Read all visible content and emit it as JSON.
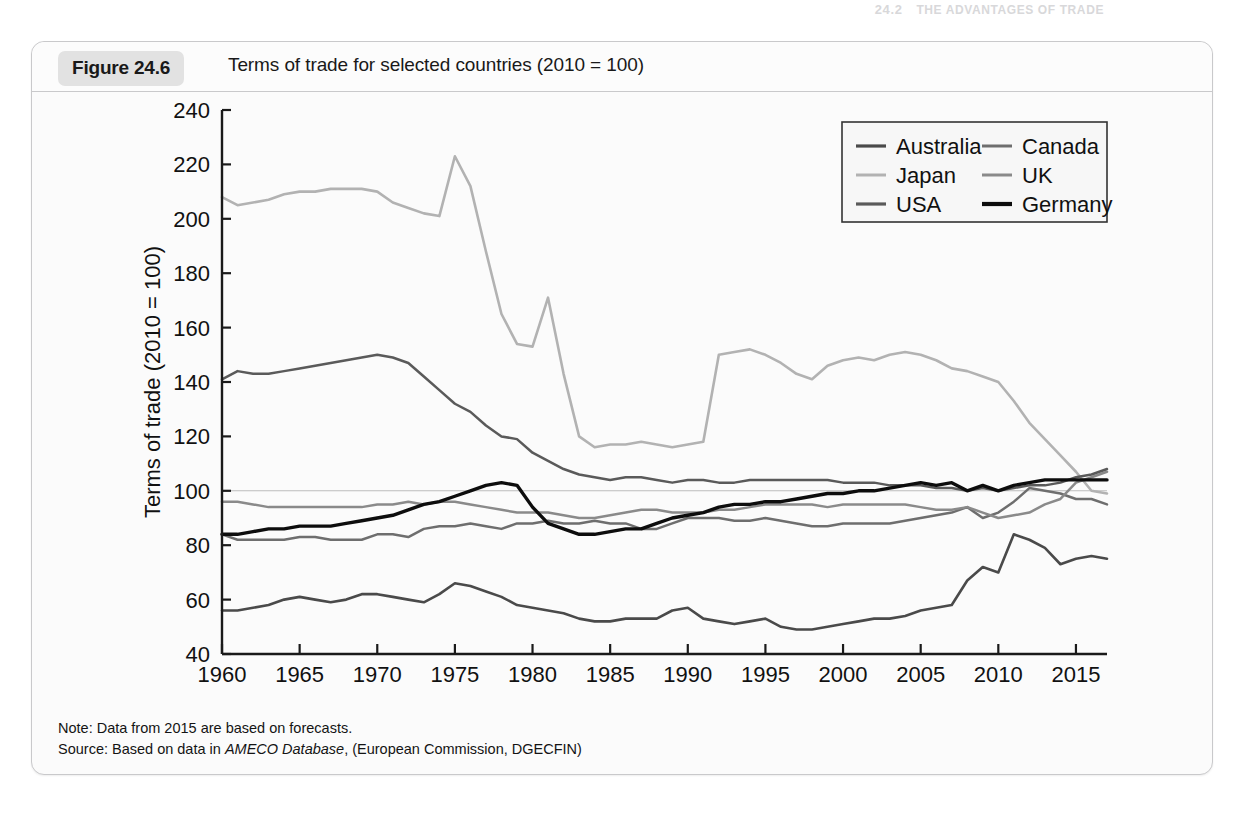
{
  "page_header": {
    "chapter_number": "24.2",
    "running_head": "THE ADVANTAGES OF TRADE"
  },
  "figure": {
    "number_label": "Figure 24.6",
    "title": "Terms of trade for selected countries (2010 = 100)",
    "note": "Note: Data from 2015 are based on forecasts.",
    "source_prefix": "Source: Based on data in ",
    "source_italic": "AMECO Database",
    "source_suffix": ", (European Commission, DGECFIN)"
  },
  "colors": {
    "australia": "#4a4a4a",
    "canada": "#6e6e6e",
    "japan": "#b2b2b2",
    "uk": "#8a8a8a",
    "usa": "#5a5a5a",
    "germany": "#0d0d0d",
    "axis": "#1a1a1a",
    "reference_line": "#bdbdbd",
    "card_bg": "#fbfbfb",
    "card_border": "#c9c9cb",
    "badge_bg": "#e2e2e2"
  },
  "chart_data": {
    "type": "line",
    "title": "Terms of trade for selected countries (2010 = 100)",
    "xlabel": "",
    "ylabel": "Terms of trade (2010 = 100)",
    "xlim": [
      1960,
      2017
    ],
    "ylim": [
      40,
      240
    ],
    "ytick_step": 20,
    "yticks": [
      40,
      60,
      80,
      100,
      120,
      140,
      160,
      180,
      200,
      220,
      240
    ],
    "xticks": [
      1960,
      1965,
      1970,
      1975,
      1980,
      1985,
      1990,
      1995,
      2000,
      2005,
      2010,
      2015
    ],
    "grid": false,
    "reference_line_y": 100,
    "legend_position": "top-right",
    "legend_columns": 2,
    "x": [
      1960,
      1961,
      1962,
      1963,
      1964,
      1965,
      1966,
      1967,
      1968,
      1969,
      1970,
      1971,
      1972,
      1973,
      1974,
      1975,
      1976,
      1977,
      1978,
      1979,
      1980,
      1981,
      1982,
      1983,
      1984,
      1985,
      1986,
      1987,
      1988,
      1989,
      1990,
      1991,
      1992,
      1993,
      1994,
      1995,
      1996,
      1997,
      1998,
      1999,
      2000,
      2001,
      2002,
      2003,
      2004,
      2005,
      2006,
      2007,
      2008,
      2009,
      2010,
      2011,
      2012,
      2013,
      2014,
      2015,
      2016,
      2017
    ],
    "series": [
      {
        "name": "Japan",
        "color": "#b2b2b2",
        "width": 2.6,
        "values": [
          208,
          205,
          206,
          207,
          209,
          210,
          210,
          211,
          211,
          211,
          210,
          206,
          204,
          202,
          201,
          223,
          212,
          188,
          165,
          154,
          153,
          171,
          143,
          120,
          116,
          117,
          117,
          118,
          117,
          116,
          117,
          118,
          150,
          151,
          152,
          150,
          147,
          143,
          141,
          146,
          148,
          149,
          148,
          150,
          151,
          150,
          148,
          145,
          144,
          142,
          140,
          133,
          125,
          119,
          113,
          107,
          100,
          99
        ]
      },
      {
        "name": "Australia",
        "color": "#4a4a4a",
        "width": 2.6,
        "values": [
          56,
          56,
          57,
          58,
          60,
          61,
          60,
          59,
          60,
          62,
          62,
          61,
          60,
          59,
          62,
          66,
          65,
          63,
          61,
          58,
          57,
          56,
          55,
          53,
          52,
          52,
          53,
          53,
          53,
          56,
          57,
          53,
          52,
          51,
          52,
          53,
          50,
          49,
          49,
          50,
          51,
          52,
          53,
          53,
          54,
          56,
          57,
          58,
          67,
          72,
          70,
          84,
          82,
          79,
          73,
          75,
          76,
          75
        ]
      },
      {
        "name": "Canada",
        "color": "#6e6e6e",
        "width": 2.5,
        "values": [
          84,
          82,
          82,
          82,
          82,
          83,
          83,
          82,
          82,
          82,
          84,
          84,
          83,
          86,
          87,
          87,
          88,
          87,
          86,
          88,
          88,
          89,
          88,
          88,
          89,
          88,
          88,
          86,
          86,
          88,
          90,
          90,
          90,
          89,
          89,
          90,
          89,
          88,
          87,
          87,
          88,
          88,
          88,
          88,
          89,
          90,
          91,
          92,
          94,
          90,
          92,
          96,
          101,
          100,
          99,
          97,
          97,
          95
        ]
      },
      {
        "name": "UK",
        "color": "#8a8a8a",
        "width": 2.5,
        "values": [
          96,
          96,
          95,
          94,
          94,
          94,
          94,
          94,
          94,
          94,
          95,
          95,
          96,
          95,
          96,
          96,
          95,
          94,
          93,
          92,
          92,
          92,
          91,
          90,
          90,
          91,
          92,
          93,
          93,
          92,
          92,
          92,
          93,
          93,
          94,
          95,
          95,
          95,
          95,
          94,
          95,
          95,
          95,
          95,
          95,
          94,
          93,
          93,
          94,
          92,
          90,
          91,
          92,
          95,
          97,
          103,
          105,
          107
        ]
      },
      {
        "name": "USA",
        "color": "#5a5a5a",
        "width": 2.5,
        "values": [
          141,
          144,
          143,
          143,
          144,
          145,
          146,
          147,
          148,
          149,
          150,
          149,
          147,
          142,
          137,
          132,
          129,
          124,
          120,
          119,
          114,
          111,
          108,
          106,
          105,
          104,
          105,
          105,
          104,
          103,
          104,
          104,
          103,
          103,
          104,
          104,
          104,
          104,
          104,
          104,
          103,
          103,
          103,
          102,
          102,
          102,
          101,
          101,
          100,
          101,
          100,
          101,
          102,
          102,
          103,
          105,
          106,
          108
        ]
      },
      {
        "name": "Germany",
        "color": "#0d0d0d",
        "width": 3.4,
        "values": [
          84,
          84,
          85,
          86,
          86,
          87,
          87,
          87,
          88,
          89,
          90,
          91,
          93,
          95,
          96,
          98,
          100,
          102,
          103,
          102,
          94,
          88,
          86,
          84,
          84,
          85,
          86,
          86,
          88,
          90,
          91,
          92,
          94,
          95,
          95,
          96,
          96,
          97,
          98,
          99,
          99,
          100,
          100,
          101,
          102,
          103,
          102,
          103,
          100,
          102,
          100,
          102,
          103,
          104,
          104,
          104,
          104,
          104
        ]
      }
    ],
    "legend": [
      {
        "label": "Australia",
        "color": "#4a4a4a",
        "width": 3.2
      },
      {
        "label": "Canada",
        "color": "#6e6e6e",
        "width": 3.0
      },
      {
        "label": "Japan",
        "color": "#b2b2b2",
        "width": 3.0
      },
      {
        "label": "UK",
        "color": "#8a8a8a",
        "width": 3.0
      },
      {
        "label": "USA",
        "color": "#5a5a5a",
        "width": 3.2
      },
      {
        "label": "Germany",
        "color": "#0d0d0d",
        "width": 4.2
      }
    ]
  }
}
